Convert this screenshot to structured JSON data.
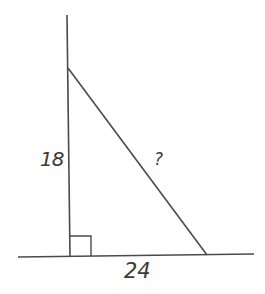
{
  "diagram": {
    "type": "right-triangle",
    "labels": {
      "vertical_leg": "18",
      "horizontal_leg": "24",
      "hypotenuse": "?"
    },
    "right_angle_marker": true,
    "stroke_color": "#4a4a4a",
    "background": "#ffffff"
  }
}
